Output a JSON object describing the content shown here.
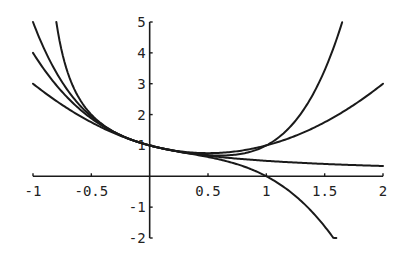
{
  "chart_data": {
    "type": "line",
    "title": "",
    "xlabel": "",
    "ylabel": "",
    "xlim": [
      -1,
      2
    ],
    "ylim": [
      -2,
      5
    ],
    "grid": false,
    "legend": null,
    "x_ticks": [
      -1,
      -0.5,
      0.5,
      1,
      1.5,
      2
    ],
    "x_tick_labels": [
      "-1",
      "-0.5",
      "0.5",
      "1",
      "1.5",
      "2"
    ],
    "y_ticks": [
      -2,
      -1,
      1,
      2,
      3,
      4,
      5
    ],
    "y_tick_labels": [
      "-2",
      "-1",
      "1",
      "2",
      "3",
      "4",
      "5"
    ],
    "series": [
      {
        "name": "1/(1+x)",
        "description": "steep curve on left, flattens toward 1/3 at x=2",
        "x": [
          -0.8,
          -0.75,
          -0.7,
          -0.6,
          -0.5,
          -0.4,
          -0.25,
          0,
          0.25,
          0.5,
          0.75,
          1,
          1.25,
          1.5,
          1.75,
          2
        ],
        "values": [
          5,
          4,
          3.33,
          2.5,
          2,
          1.67,
          1.33,
          1,
          0.8,
          0.67,
          0.57,
          0.5,
          0.44,
          0.4,
          0.36,
          0.33
        ]
      },
      {
        "name": "1 - x + x^2",
        "x": [
          -1,
          -0.75,
          -0.5,
          -0.25,
          0,
          0.25,
          0.5,
          0.75,
          1,
          1.25,
          1.5,
          1.75,
          2
        ],
        "values": [
          3,
          2.31,
          1.75,
          1.31,
          1,
          0.81,
          0.75,
          0.81,
          1,
          1.31,
          1.75,
          2.31,
          2.9
        ]
      },
      {
        "name": "1 - x + x^2 - x^3",
        "x": [
          -1,
          -0.75,
          -0.5,
          -0.25,
          0,
          0.25,
          0.5,
          0.75,
          1,
          1.25,
          1.5,
          1.6
        ],
        "values": [
          4,
          2.73,
          1.88,
          1.33,
          1,
          0.8,
          0.63,
          0.39,
          0,
          -0.64,
          -1.63,
          -2
        ]
      },
      {
        "name": "1 - x + x^2 - x^3 + x^4",
        "x": [
          -1,
          -0.75,
          -0.5,
          -0.25,
          0,
          0.25,
          0.5,
          0.75,
          1,
          1.25,
          1.5,
          1.65
        ],
        "values": [
          5,
          3.05,
          1.94,
          1.33,
          1,
          0.8,
          0.69,
          0.71,
          1,
          1.8,
          3.44,
          5
        ]
      }
    ]
  }
}
